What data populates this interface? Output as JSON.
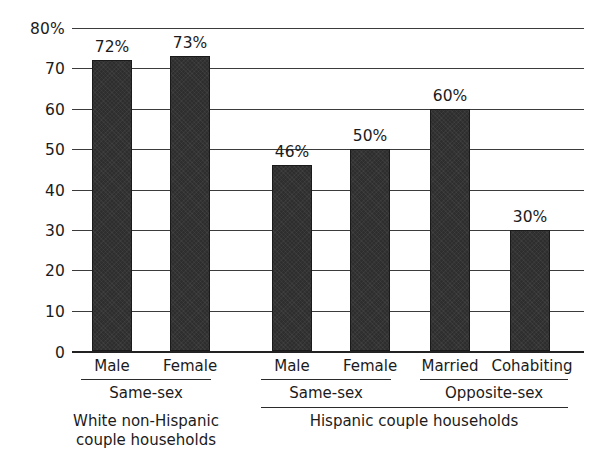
{
  "chart_data": {
    "type": "bar",
    "title": "",
    "subtitle": "",
    "xlabel": "",
    "ylabel": "",
    "ylim": [
      0,
      80
    ],
    "grid": true,
    "legend": "none",
    "bar_color": "#2e2e2e",
    "y_ticks": [
      {
        "value": 80,
        "label": "80%"
      },
      {
        "value": 70,
        "label": "70"
      },
      {
        "value": 60,
        "label": "60"
      },
      {
        "value": 50,
        "label": "50"
      },
      {
        "value": 40,
        "label": "40"
      },
      {
        "value": 30,
        "label": "30"
      },
      {
        "value": 20,
        "label": "20"
      },
      {
        "value": 10,
        "label": "10"
      },
      {
        "value": 0,
        "label": "0"
      }
    ],
    "categories": [
      "Male",
      "Female",
      "Male",
      "Female",
      "Married",
      "Cohabiting"
    ],
    "values": [
      72,
      73,
      46,
      50,
      60,
      30
    ],
    "value_labels": [
      "72%",
      "73%",
      "46%",
      "50%",
      "60%",
      "30%"
    ],
    "groups": [
      {
        "label": "Same-sex",
        "members": [
          0,
          1
        ]
      },
      {
        "label": "Same-sex",
        "members": [
          2,
          3
        ]
      },
      {
        "label": "Opposite-sex",
        "members": [
          4,
          5
        ]
      }
    ],
    "super_groups": [
      {
        "label": "White non-Hispanic\ncouple households",
        "line1": "White non-Hispanic",
        "line2": "couple households",
        "groups": [
          0
        ],
        "has_rule": false
      },
      {
        "label": "Hispanic couple households",
        "line1": "Hispanic couple households",
        "line2": "",
        "groups": [
          1,
          2
        ],
        "has_rule": true
      }
    ]
  },
  "bars": [
    {
      "name": "bar-white-samesex-male",
      "label": "Male",
      "value": 72,
      "value_label": "72%",
      "x": 92,
      "width": 40
    },
    {
      "name": "bar-white-samesex-female",
      "label": "Female",
      "value": 73,
      "value_label": "73%",
      "x": 170,
      "width": 40
    },
    {
      "name": "bar-hispanic-samesex-male",
      "label": "Male",
      "value": 46,
      "value_label": "46%",
      "x": 272,
      "width": 40
    },
    {
      "name": "bar-hispanic-samesex-female",
      "label": "Female",
      "value": 50,
      "value_label": "50%",
      "x": 350,
      "width": 40
    },
    {
      "name": "bar-hispanic-opposite-married",
      "label": "Married",
      "value": 60,
      "value_label": "60%",
      "x": 430,
      "width": 40
    },
    {
      "name": "bar-hispanic-opposite-cohabiting",
      "label": "Cohabiting",
      "value": 30,
      "value_label": "30%",
      "x": 510,
      "width": 40
    }
  ]
}
